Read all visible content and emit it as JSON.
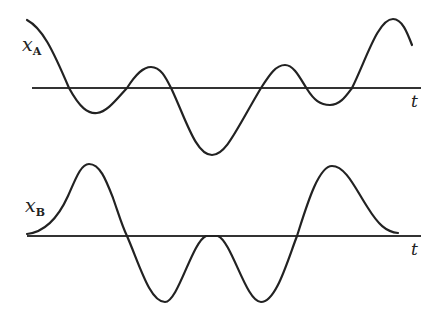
{
  "diagram": {
    "panels": [
      {
        "id": "A",
        "label_main": "x",
        "label_sub": "A",
        "axis_label": "t",
        "axis": {
          "x1": 32,
          "x2": 421,
          "y": 88
        },
        "curve_path": "M27,20 C42,28 52,48 69,88 C80,108 88,114 97,113 C107,112 116,100 127,88 C136,74 143,67 151,67 C161,67 166,78 172,90 C186,120 196,155 212,155 C226,155 236,130 261,88 C270,74 276,65 285,65 C294,65 300,78 307,89 C314,100 320,105 330,105 C340,105 346,96 352,88 C366,60 378,19 393,19 C402,19 407,32 412,45"
      },
      {
        "id": "B",
        "label_main": "x",
        "label_sub": "B",
        "axis_label": "t",
        "axis": {
          "x1": 27,
          "x2": 421,
          "y": 236
        },
        "curve_path": "M27,234 C45,232 58,218 68,196 C76,178 81,164 89,164 C100,164 106,180 113,198 C118,212 122,226 127,236 C140,266 150,302 165,302 C178,302 192,242 206,236 L218,236 C232,242 246,302 261,302 C276,302 287,262 297,236 C306,208 318,166 332,166 C346,166 356,190 368,208 C378,224 386,232 398,233"
      }
    ],
    "colors": {
      "stroke": "#222222",
      "axis": "#333333",
      "background": "#ffffff"
    }
  }
}
